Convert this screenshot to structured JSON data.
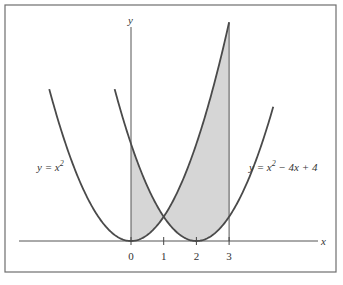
{
  "figure": {
    "x_axis_label": "x",
    "y_axis_label": "y",
    "tick_values": [
      0,
      1,
      2,
      3
    ],
    "tick_labels": [
      "0",
      "1",
      "2",
      "3"
    ],
    "curves": [
      {
        "name": "parabola-x-squared",
        "label_parts": [
          "y = x",
          "2",
          ""
        ],
        "coefficients": [
          1,
          0,
          0
        ],
        "domain": [
          -2.5,
          3
        ]
      },
      {
        "name": "parabola-shifted",
        "label_parts": [
          "y = x",
          "2",
          " − 4x + 4"
        ],
        "coefficients": [
          1,
          -4,
          4
        ],
        "domain": [
          -0.5,
          4.35
        ]
      }
    ],
    "shaded_region": {
      "description": "Region between y = x^2 and y = x^2 - 4x + 4 from x = 0 to x = 3",
      "x_from": 0,
      "x_to": 3,
      "intersection": [
        1,
        1
      ]
    },
    "colors": {
      "shade": "#d6d6d6",
      "curve": "#4a4a4a"
    }
  }
}
